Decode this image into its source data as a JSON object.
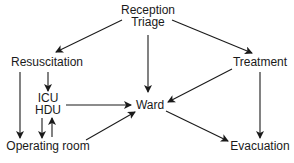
{
  "diagram": {
    "type": "flowchart",
    "nodes": [
      {
        "id": "reception",
        "lines": [
          "Reception",
          "Triage"
        ],
        "x": 148,
        "y": [
          14,
          26
        ]
      },
      {
        "id": "resuscitation",
        "lines": [
          "Resuscitation"
        ],
        "x": 47,
        "y": [
          66
        ]
      },
      {
        "id": "treatment",
        "lines": [
          "Treatment"
        ],
        "x": 260,
        "y": [
          66
        ]
      },
      {
        "id": "icu_hdu",
        "lines": [
          "ICU",
          "HDU"
        ],
        "x": 48,
        "y": [
          102,
          114
        ]
      },
      {
        "id": "ward",
        "lines": [
          "Ward"
        ],
        "x": 150,
        "y": [
          109
        ]
      },
      {
        "id": "operating_room",
        "lines": [
          "Operating room"
        ],
        "x": 48,
        "y": [
          150
        ]
      },
      {
        "id": "evacuation",
        "lines": [
          "Evacuation"
        ],
        "x": 260,
        "y": [
          150
        ]
      }
    ],
    "edges": [
      {
        "from": "reception",
        "to": "resuscitation",
        "path": [
          122,
          20,
          56,
          52
        ]
      },
      {
        "from": "reception",
        "to": "ward",
        "path": [
          148,
          35,
          148,
          92
        ]
      },
      {
        "from": "reception",
        "to": "treatment",
        "path": [
          172,
          20,
          252,
          53
        ]
      },
      {
        "from": "resuscitation",
        "to": "icu_hdu",
        "path": [
          48,
          72,
          48,
          91
        ]
      },
      {
        "from": "resuscitation",
        "to": "operating_room",
        "path": [
          20,
          72,
          20,
          138
        ]
      },
      {
        "from": "icu_hdu",
        "to": "ward",
        "path": [
          66,
          105,
          131,
          105
        ]
      },
      {
        "from": "icu_hdu",
        "to": "operating_room",
        "path": [
          42,
          118,
          42,
          138
        ]
      },
      {
        "from": "operating_room",
        "to": "icu_hdu",
        "path": [
          52,
          137,
          52,
          118
        ]
      },
      {
        "from": "operating_room",
        "to": "ward",
        "path": [
          86,
          140,
          135,
          112
        ]
      },
      {
        "from": "treatment",
        "to": "ward",
        "path": [
          232,
          69,
          168,
          102
        ]
      },
      {
        "from": "treatment",
        "to": "evacuation",
        "path": [
          260,
          72,
          260,
          138
        ]
      },
      {
        "from": "ward",
        "to": "evacuation",
        "path": [
          166,
          111,
          228,
          141
        ]
      }
    ],
    "colors": {
      "line": "#1a1a1a",
      "text": "#1a1a1a",
      "background": "#ffffff"
    }
  }
}
